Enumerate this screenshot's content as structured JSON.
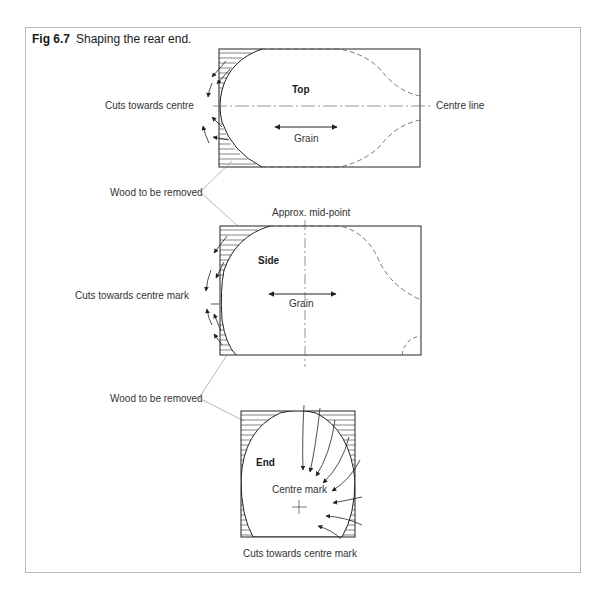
{
  "figure": {
    "number": "Fig 6.7",
    "title": "Shaping the rear end."
  },
  "views": {
    "top": {
      "title": "Top",
      "grain_label": "Grain",
      "centre_line_label": "Centre line",
      "cuts_label": "Cuts towards centre"
    },
    "side": {
      "title": "Side",
      "grain_label": "Grain",
      "midpoint_label": "Approx. mid-point",
      "cuts_label": "Cuts towards centre mark"
    },
    "end": {
      "title": "End",
      "centre_mark_label": "Centre mark",
      "cuts_label": "Cuts towards centre mark"
    }
  },
  "callouts": {
    "wood_removed_1": "Wood to be removed",
    "wood_removed_2": "Wood to be removed"
  },
  "colors": {
    "line": "#222222",
    "dashed": "#555555",
    "leader": "#888888",
    "frame": "#b8b8b8"
  }
}
